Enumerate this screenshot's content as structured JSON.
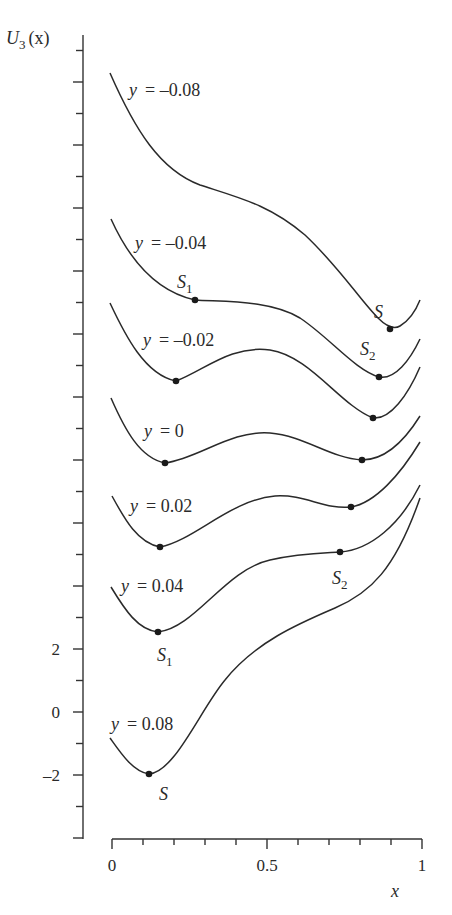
{
  "chart_data": {
    "type": "line",
    "title": "",
    "xlabel": "x",
    "ylabel": "U_3(x)",
    "xlim": [
      0,
      1
    ],
    "x_ticks": [
      "0",
      "0.5",
      "1"
    ],
    "y_ticks": [
      "2",
      "0",
      "-2"
    ],
    "grid": false,
    "legend": "none (curves labeled inline)",
    "note": "Curves are vertically offset for display; only the y=0.08 curve aligns with the labeled y-axis values.",
    "series": [
      {
        "name": "y = -0.08",
        "label": "y = –0.08",
        "critical_points": [
          {
            "name": "S",
            "x": 0.9
          }
        ]
      },
      {
        "name": "y = -0.04",
        "label": "y = –0.04",
        "critical_points": [
          {
            "name": "S1",
            "x": 0.27
          },
          {
            "name": "S2",
            "x": 0.86
          }
        ]
      },
      {
        "name": "y = -0.02",
        "label": "y = –0.02",
        "critical_points": [
          {
            "name": "min",
            "x": 0.21
          },
          {
            "name": "min",
            "x": 0.84
          }
        ]
      },
      {
        "name": "y = 0",
        "label": "y = 0",
        "critical_points": [
          {
            "name": "min",
            "x": 0.17
          },
          {
            "name": "min",
            "x": 0.81
          }
        ]
      },
      {
        "name": "y = 0.02",
        "label": "y = 0.02",
        "critical_points": [
          {
            "name": "min",
            "x": 0.15
          },
          {
            "name": "min",
            "x": 0.77
          }
        ]
      },
      {
        "name": "y = 0.04",
        "label": "y = 0.04",
        "critical_points": [
          {
            "name": "S1",
            "x": 0.15
          },
          {
            "name": "S2",
            "x": 0.74
          }
        ]
      },
      {
        "name": "y = 0.08",
        "label": "y = 0.08",
        "critical_points": [
          {
            "name": "S",
            "x": 0.12,
            "y": -1.9
          }
        ]
      }
    ]
  },
  "axes": {
    "y_label_main": "U",
    "y_label_sub": "3",
    "y_label_arg": "(x)",
    "x_label": "x",
    "x_tick_0": "0",
    "x_tick_05": "0.5",
    "x_tick_1": "1",
    "y_tick_2": "2",
    "y_tick_0": "0",
    "y_tick_m2": "–2"
  },
  "labels": {
    "c1": "y = –0.08",
    "c2": "y = –0.04",
    "c3": "y = –0.02",
    "c4": "y = 0",
    "c5": "y = 0.02",
    "c6": "y = 0.04",
    "c7": "y = 0.08",
    "S_top": "S",
    "S1_top": "S",
    "S1_top_sub": "1",
    "S2_top": "S",
    "S2_top_sub": "2",
    "S2_mid": "S",
    "S2_mid_sub": "2",
    "S1_bot": "S",
    "S1_bot_sub": "1",
    "S_bot": "S"
  }
}
